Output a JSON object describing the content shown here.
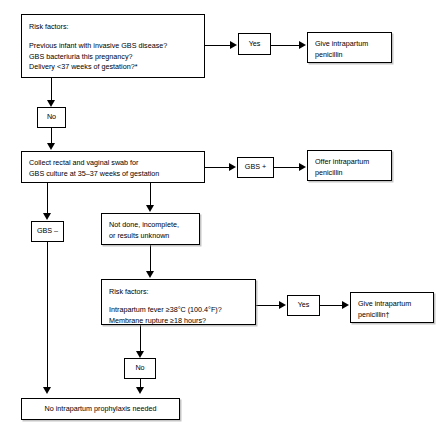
{
  "diagram": {
    "accent_color": "#000000",
    "background_color": "#ffffff"
  },
  "nodes": {
    "risk_factors_top": {
      "label": "Risk factors:",
      "body": "Previous infant with invasive GBS disease?\nGBS bacteriuria this pregnancy?\nDelivery <37 weeks of gestation?*"
    },
    "yes_top": {
      "label": "Yes"
    },
    "give_penicillin_top": {
      "label": "Give intrapartum\npenicillin"
    },
    "no_top": {
      "label": "No"
    },
    "collect_swab": {
      "label": "Collect rectal and vaginal swab for\nGBS culture at 35–37 weeks of gestation"
    },
    "gbs_positive": {
      "label": "GBS +"
    },
    "offer_penicillin": {
      "label": "Offer intrapartum\npenicillin"
    },
    "gbs_negative": {
      "label": "GBS –"
    },
    "not_done": {
      "label": "Not done, incomplete,\nor results unknown"
    },
    "risk_factors_lower": {
      "label": "Risk factors:",
      "body": "Intrapartum fever ≥38°C (100.4°F)?\nMembrane rupture ≥18 hours?"
    },
    "yes_lower": {
      "label": "Yes"
    },
    "give_penicillin_lower": {
      "label": "Give intrapartum\npenicillin†"
    },
    "no_lower": {
      "label": "No"
    },
    "no_prophylaxis": {
      "label": "No intrapartum prophylaxis needed"
    }
  }
}
